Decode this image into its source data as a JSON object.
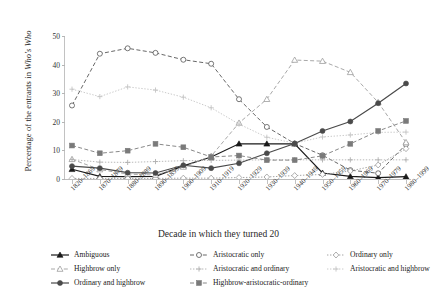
{
  "chart_data": {
    "type": "line",
    "title": "",
    "xlabel": "Decade in which they turned 20",
    "ylabel": "Percentage of the entrants in Who's Who",
    "ylabel_plain": "Percentage of the entrants in ",
    "ylabel_italic": "Who's Who",
    "ylim": [
      0,
      50
    ],
    "yticks": [
      0,
      10,
      20,
      30,
      40,
      50
    ],
    "grid": false,
    "legend_position": "bottom",
    "categories": [
      "1820–1869",
      "1870–1879",
      "1880–1889",
      "1890–1899",
      "1900–1909",
      "1910–1919",
      "1920–1929",
      "1930–1939",
      "1940–1949",
      "1950–1959",
      "1960–1969",
      "1970–1979",
      "1980–1999"
    ],
    "series": [
      {
        "name": "Ambiguous",
        "marker": "filled-triangle",
        "line": "solid",
        "color": "#1a1a1a",
        "values": [
          3.4,
          0.9,
          0.8,
          0.9,
          4.6,
          7.7,
          12.3,
          12.3,
          12.3,
          2.1,
          0.9,
          0.5,
          0.8
        ]
      },
      {
        "name": "Aristocratic only",
        "marker": "open-circle",
        "line": "dashed",
        "color": "#565656",
        "values": [
          25.7,
          43.8,
          45.7,
          44.1,
          41.7,
          40.3,
          27.9,
          18.2,
          12.4,
          8.3,
          3.1,
          2.0,
          12.1
        ]
      },
      {
        "name": "Ordinary only",
        "marker": "open-diamond",
        "line": "dotted",
        "color": "#9b9b9b",
        "values": [
          0.2,
          0.2,
          0.2,
          0.2,
          0.3,
          0.3,
          0.5,
          0.7,
          1.2,
          1.6,
          2.8,
          4.9,
          10.6
        ]
      },
      {
        "name": "Highbrow only",
        "marker": "open-triangle",
        "line": "dashed",
        "color": "#9e9e9e",
        "values": [
          6.9,
          3.3,
          1.7,
          1.4,
          4.2,
          8.0,
          19.6,
          27.9,
          41.6,
          41.2,
          37.3,
          26.8,
          12.8
        ]
      },
      {
        "name": "Aristocratic and ordinary",
        "marker": "plus",
        "line": "dotted",
        "color": "#b0b0b0",
        "values": [
          6.8,
          5.9,
          5.8,
          6.1,
          6.4,
          6.5,
          6.6,
          6.7,
          6.7,
          6.7,
          6.7,
          6.7,
          6.7
        ]
      },
      {
        "name": "Aristocratic and highbrow",
        "marker": "plus",
        "line": "dotted",
        "color": "#c4c4c4",
        "values": [
          31.4,
          28.8,
          32.2,
          31.1,
          28.6,
          24.9,
          19.2,
          14.6,
          12.5,
          14.7,
          15.4,
          16.3,
          16.4
        ]
      },
      {
        "name": "Ordinary and highbrow",
        "marker": "filled-circle",
        "line": "solid",
        "color": "#4a4a4a",
        "values": [
          4.5,
          3.8,
          2.2,
          2.1,
          4.8,
          3.8,
          5.5,
          9.0,
          12.4,
          16.8,
          20.1,
          26.5,
          33.4
        ]
      },
      {
        "name": "Highbrow-aristocratic-ordinary",
        "marker": "filled-square",
        "line": "dashed",
        "color": "#7a7a7a",
        "values": [
          11.7,
          9.0,
          9.9,
          12.3,
          11.1,
          7.7,
          8.2,
          6.6,
          6.6,
          8.1,
          12.3,
          16.8,
          20.3
        ]
      }
    ]
  },
  "legend": {
    "items": [
      {
        "label": "Ambiguous"
      },
      {
        "label": "Aristocratic only"
      },
      {
        "label": "Ordinary only"
      },
      {
        "label": "Highbrow only"
      },
      {
        "label": "Aristocratic and ordinary"
      },
      {
        "label": "Aristocratic and highbrow"
      },
      {
        "label": "Ordinary and highbrow"
      },
      {
        "label": "Highbrow-aristocratic-ordinary"
      }
    ]
  }
}
